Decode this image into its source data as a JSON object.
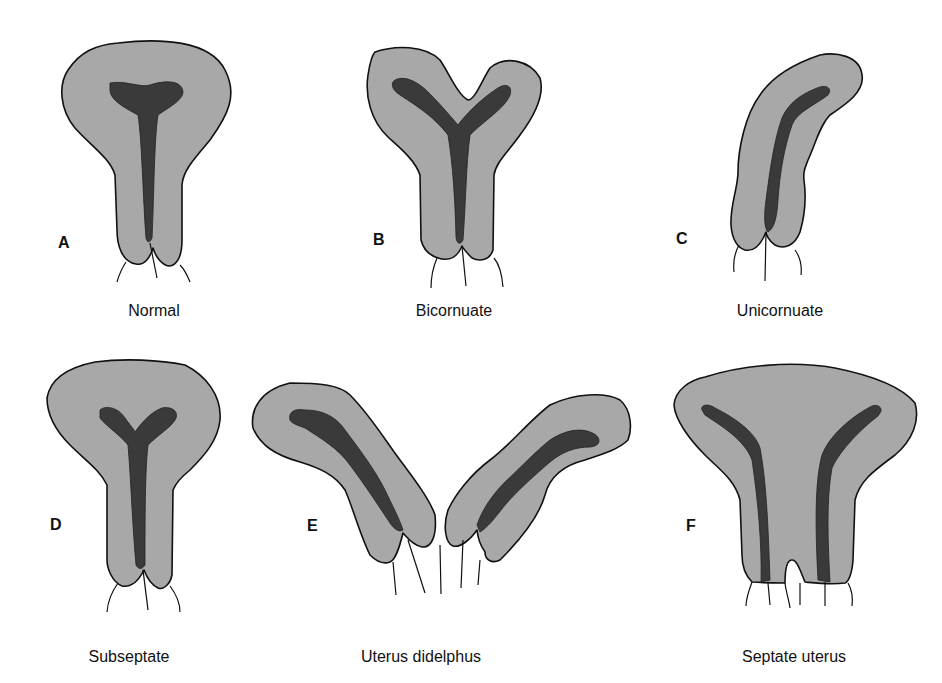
{
  "figure": {
    "panels": [
      {
        "letter": "A",
        "caption": "Normal"
      },
      {
        "letter": "B",
        "caption": "Bicornuate"
      },
      {
        "letter": "C",
        "caption": "Unicornuate"
      },
      {
        "letter": "D",
        "caption": "Subseptate"
      },
      {
        "letter": "E",
        "caption": "Uterus didelphus"
      },
      {
        "letter": "F",
        "caption": "Septate uterus"
      }
    ],
    "colors": {
      "background": "#ffffff",
      "wall": "#a8a8a8",
      "cavity": "#3a3a3a",
      "outline": "#111111"
    }
  }
}
